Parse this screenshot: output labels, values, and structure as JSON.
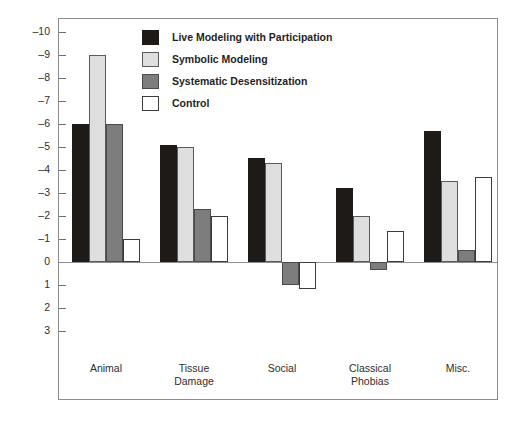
{
  "chart_data": {
    "type": "bar",
    "title": "",
    "xlabel": "",
    "ylabel": "Change in Intensity of Fears",
    "categories": [
      "Animal",
      "Tissue Damage",
      "Social",
      "Classical Phobias",
      "Misc."
    ],
    "category_lines": [
      [
        "Animal"
      ],
      [
        "Tissue",
        "Damage"
      ],
      [
        "Social"
      ],
      [
        "Classical",
        "Phobias"
      ],
      [
        "Misc."
      ]
    ],
    "ylim": [
      -10.6,
      3.0
    ],
    "y_ticks": [
      -10,
      -9,
      -8,
      -7,
      -6,
      -5,
      -4,
      -3,
      -2,
      -1,
      0,
      1,
      2,
      3
    ],
    "y_tick_labels": [
      "–10",
      "–9",
      "–8",
      "–7",
      "–6",
      "–5",
      "–4",
      "–3",
      "–2",
      "–1",
      "0",
      "1",
      "2",
      "3"
    ],
    "y_axis_inverted": true,
    "grid": false,
    "legend_position": "top-center",
    "series": [
      {
        "name": "Live Modeling with Participation",
        "key": "black",
        "color": "#1d1a18",
        "values": [
          -6.0,
          -5.1,
          -4.5,
          -3.2,
          -5.7
        ]
      },
      {
        "name": "Symbolic Modeling",
        "key": "light",
        "color": "#dedede",
        "values": [
          -9.0,
          -5.0,
          -4.3,
          -2.0,
          -3.5
        ]
      },
      {
        "name": "Systematic Desensitization",
        "key": "dark",
        "color": "#7d7d7d",
        "values": [
          -6.0,
          -2.3,
          1.0,
          0.35,
          -0.5
        ]
      },
      {
        "name": "Control",
        "key": "white",
        "color": "#ffffff",
        "values": [
          -1.0,
          -2.0,
          1.2,
          -1.35,
          -3.7
        ]
      }
    ]
  },
  "legend": {
    "entries": [
      {
        "label": "Live Modeling with Participation",
        "swatch": "black"
      },
      {
        "label": "Symbolic Modeling",
        "swatch": "light"
      },
      {
        "label": "Systematic Desensitization",
        "swatch": "dark"
      },
      {
        "label": "Control",
        "swatch": "white"
      }
    ]
  }
}
